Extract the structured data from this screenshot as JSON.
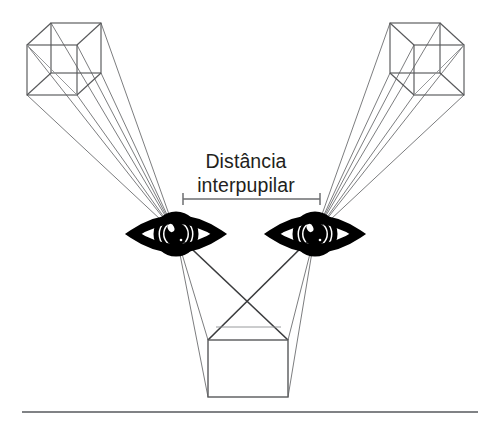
{
  "figure": {
    "title_line_1": "Distância",
    "title_line_2": "interpupilar",
    "language": "pt-BR",
    "background_color": "#ffffff",
    "line_color": "#58595b",
    "ray_color": "#6d6e71",
    "eye_color": "#000000",
    "text_color": "#231f20",
    "rule_color": "#808285"
  },
  "annotation": {
    "measure_label_line_1": "Distância",
    "measure_label_line_2": "interpupilar",
    "measure_bar_start_x": 183,
    "measure_bar_end_x": 320,
    "measure_bar_y": 199,
    "measure_bar_tick_height": 12
  },
  "eyes": [
    {
      "name": "left-eye",
      "center_x": 176,
      "center_y": 234,
      "pupil_x": 176,
      "pupil_y": 234,
      "half_width": 43,
      "half_height": 23
    },
    {
      "name": "right-eye",
      "center_x": 315,
      "center_y": 234,
      "pupil_x": 315,
      "pupil_y": 234,
      "half_width": 43,
      "half_height": 23
    }
  ],
  "objects": [
    {
      "name": "left-cube",
      "type": "wireframe-cube",
      "front_left_x": 27,
      "front_top_y": 45,
      "front_size": 50,
      "depth_dx": 24,
      "depth_dy": -22,
      "perspective": "vanishing-right"
    },
    {
      "name": "right-cube",
      "type": "wireframe-cube",
      "front_left_x": 414,
      "front_top_y": 45,
      "front_size": 50,
      "depth_dx": -24,
      "depth_dy": -22,
      "perspective": "vanishing-left"
    },
    {
      "name": "center-square",
      "type": "square",
      "left_x": 208,
      "top_y": 340,
      "width": 80,
      "height": 57
    }
  ],
  "baseline_rule": {
    "x_start": 22,
    "x_end": 478,
    "y": 412
  }
}
